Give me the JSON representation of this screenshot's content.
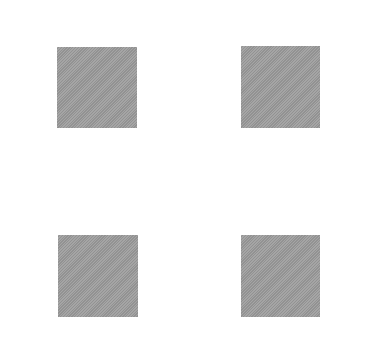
{
  "canvas": {
    "width": 391,
    "height": 350,
    "background": "#ffffff"
  },
  "squares": [
    {
      "id": "top-left",
      "x": 57,
      "y": 47,
      "width": 80,
      "height": 81,
      "color": "#9b9b9b"
    },
    {
      "id": "top-right",
      "x": 241,
      "y": 46,
      "width": 79,
      "height": 82,
      "color": "#9b9b9b"
    },
    {
      "id": "bottom-left",
      "x": 58,
      "y": 235,
      "width": 80,
      "height": 82,
      "color": "#9b9b9b"
    },
    {
      "id": "bottom-right",
      "x": 241,
      "y": 235,
      "width": 79,
      "height": 82,
      "color": "#9b9b9b"
    }
  ]
}
